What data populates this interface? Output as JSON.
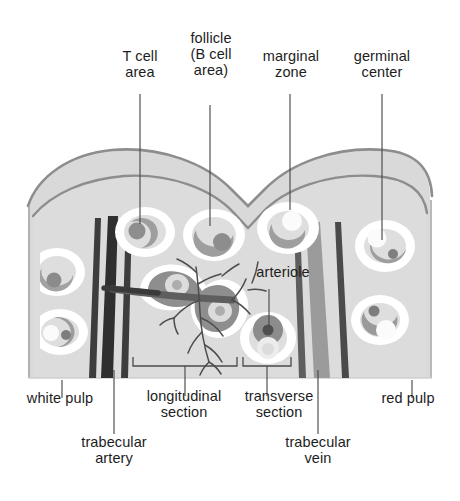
{
  "figure": {
    "background_color": "#ffffff",
    "parenchyma_color": "#dedede",
    "capsule_band_color": "#d2d2d2",
    "outline_color": "#8a8a8a",
    "marginal_zone_color": "#ffffff",
    "follicle_cell_color": "#9d9d9d",
    "germinal_center_color": "#f2f2f2",
    "artery_color": "#3a3a3a",
    "vein_color": "#9a9a9a",
    "arteriole_color": "#6f6f6f",
    "leader_color": "#4a4a4a",
    "text_color": "#1d1d1d"
  },
  "labels": {
    "t_cell_area": "T cell\narea",
    "follicle_b_cell_area": "follicle\n(B cell\narea)",
    "marginal_zone": "marginal\nzone",
    "germinal_center": "germinal\ncenter",
    "arteriole": "arteriole",
    "white_pulp": "white pulp",
    "longitudinal_section": "longitudinal\nsection",
    "transverse_section": "transverse\nsection",
    "red_pulp": "red pulp",
    "trabecular_artery": "trabecular\nartery",
    "trabecular_vein": "trabecular\nvein"
  },
  "leader_lines": [
    {
      "name": "t-cell-area-leader",
      "x1": 140,
      "y1": 94,
      "x2": 140,
      "y2": 222
    },
    {
      "name": "follicle-leader",
      "x1": 210,
      "y1": 105,
      "x2": 210,
      "y2": 222
    },
    {
      "name": "marginal-zone-leader",
      "x1": 290,
      "y1": 94,
      "x2": 290,
      "y2": 212
    },
    {
      "name": "germinal-center-leader",
      "x1": 382,
      "y1": 94,
      "x2": 382,
      "y2": 238
    },
    {
      "name": "arteriole-leader",
      "x1": 269,
      "y1": 288,
      "x2": 269,
      "y2": 327
    },
    {
      "name": "white-pulp-leader",
      "x1": 62,
      "y1": 380,
      "x2": 62,
      "y2": 398
    },
    {
      "name": "trabecular-artery-leader",
      "x1": 114,
      "y1": 378,
      "x2": 114,
      "y2": 432
    },
    {
      "name": "longitudinal-section-leader",
      "x1": 185,
      "y1": 378,
      "x2": 185,
      "y2": 396
    },
    {
      "name": "transverse-section-leader",
      "x1": 267,
      "y1": 378,
      "x2": 267,
      "y2": 396
    },
    {
      "name": "trabecular-vein-leader",
      "x1": 318,
      "y1": 378,
      "x2": 318,
      "y2": 432
    },
    {
      "name": "red-pulp-leader",
      "x1": 412,
      "y1": 378,
      "x2": 412,
      "y2": 398
    }
  ],
  "brackets": [
    {
      "name": "longitudinal-section-bracket",
      "x_start": 133,
      "x_end": 237,
      "y": 365
    },
    {
      "name": "transverse-section-bracket",
      "x_start": 243,
      "x_end": 291,
      "y": 365
    }
  ],
  "structures": {
    "capsule_notches": 2,
    "follicle_count": 9,
    "trabecular_artery_bands": 2,
    "trabecular_vein_bands": 3
  }
}
